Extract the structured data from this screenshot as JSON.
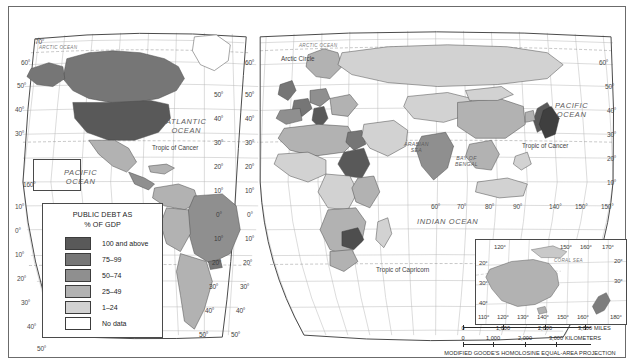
{
  "map": {
    "title": "World map of public debt as percentage of GDP",
    "projection_note": "MODIFIED GOODE'S HOMOLOSINE EQUAL-AREA PROJECTION"
  },
  "legend": {
    "title_line1": "PUBLIC DEBT AS",
    "title_line2": "% OF GDP",
    "items": [
      {
        "label": "100 and above",
        "color": "#595959"
      },
      {
        "label": "75–99",
        "color": "#767676"
      },
      {
        "label": "50–74",
        "color": "#8f8f8f"
      },
      {
        "label": "25–49",
        "color": "#b2b2b2"
      },
      {
        "label": "1–24",
        "color": "#d2d2d2"
      },
      {
        "label": "No data",
        "color": "#ffffff"
      }
    ]
  },
  "ocean_labels": [
    {
      "name": "arctic-ocean-left",
      "text": "ARCTIC OCEAN"
    },
    {
      "name": "arctic-ocean-right",
      "text": "ARCTIC OCEAN"
    },
    {
      "name": "atlantic-ocean",
      "line1": "ATLANTIC",
      "line2": "OCEAN"
    },
    {
      "name": "pacific-ocean-left",
      "line1": "PACIFIC",
      "line2": "OCEAN"
    },
    {
      "name": "pacific-ocean-right",
      "line1": "PACIFIC",
      "line2": "OCEAN"
    },
    {
      "name": "indian-ocean",
      "text": "INDIAN   OCEAN"
    },
    {
      "name": "arabian-sea",
      "line1": "ARABIAN",
      "line2": "SEA"
    },
    {
      "name": "bay-of-bengal",
      "line1": "BAY OF",
      "line2": "BENGAL"
    },
    {
      "name": "coral-sea",
      "text": "CORAL SEA"
    }
  ],
  "reference_lines": {
    "arctic_circle": "Arctic Circle",
    "tropic_of_cancer_left": "Tropic of Cancer",
    "tropic_of_cancer_right": "Tropic of Cancer",
    "tropic_of_capricorn": "Tropic of Capricorn"
  },
  "graticule": {
    "left_latitudes": [
      "70°",
      "60°",
      "50°",
      "40°",
      "30°",
      "10°",
      "0°",
      "10°",
      "20°",
      "30°",
      "40°",
      "50°"
    ],
    "left_longitude": "160°",
    "right_latitudes": [
      "60°",
      "50°",
      "40°",
      "30°",
      "20°",
      "10°"
    ],
    "right_longitude": "150°",
    "seam_latitudes_left": [
      "50°",
      "40°",
      "30°",
      "20°",
      "10°",
      "0°",
      "10°",
      "20°",
      "30°",
      "40°",
      "50°"
    ],
    "seam_latitudes_right": [
      "60°",
      "50°",
      "40°",
      "30°",
      "20°",
      "10°",
      "0°",
      "10°",
      "20°",
      "30°",
      "40°",
      "50°"
    ],
    "equator_longitudes": [
      "60°",
      "70°",
      "80°",
      "90°",
      "140°",
      "150°"
    ]
  },
  "australia_inset": {
    "top_longitudes": [
      "120°",
      "150°",
      "160°",
      "170°"
    ],
    "bottom_longitudes": [
      "110°",
      "120°",
      "130°",
      "140°",
      "150°",
      "160°",
      "180°"
    ],
    "left_latitudes": [
      "20°",
      "30°",
      "40°"
    ],
    "right_latitudes": [
      "20°",
      "30°"
    ],
    "sea_label": "CORAL SEA"
  },
  "scale": {
    "miles": {
      "values": [
        "0",
        "1,000",
        "2,000",
        "3,000"
      ],
      "unit": "MILES"
    },
    "kilometers": {
      "values": [
        "0",
        "1,000",
        "2,000",
        "3,000"
      ],
      "unit": "KILOMETERS"
    }
  }
}
